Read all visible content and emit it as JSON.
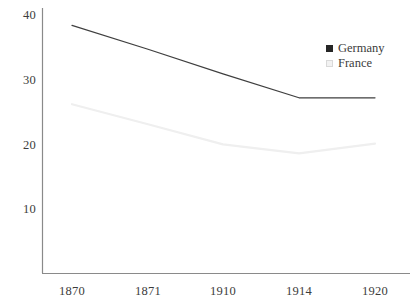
{
  "chart_data": {
    "type": "line",
    "title": "",
    "subtitle": "",
    "xlabel": "",
    "ylabel": "",
    "categories": [
      "1870",
      "1871",
      "1910",
      "1914",
      "1920"
    ],
    "xtick_labels": [
      "1870",
      "1871",
      "1910",
      "1914",
      "1920"
    ],
    "ytick_labels": [
      "40",
      "30",
      "20",
      "10"
    ],
    "ytick_values": [
      40,
      30,
      20,
      10
    ],
    "ylim": [
      0,
      41
    ],
    "xlim_categories": [
      "1870",
      "1920"
    ],
    "grid": false,
    "legend_position": "top-right",
    "series": [
      {
        "name": "Germany",
        "color": "#3f3f3f",
        "marker": "filled-square",
        "values": [
          38.4,
          34.7,
          30.9,
          27.2,
          27.2
        ]
      },
      {
        "name": "France",
        "color": "#efefef",
        "marker": "outlined-square",
        "values": [
          26.2,
          23.1,
          20.0,
          18.6,
          20.1
        ]
      }
    ],
    "annotations": []
  },
  "legend": {
    "items": [
      {
        "label": "Germany",
        "swatch": "filled-square-icon"
      },
      {
        "label": "France",
        "swatch": "outlined-square-icon"
      }
    ]
  },
  "axes": {
    "y_labels": [
      "40",
      "30",
      "20",
      "10"
    ],
    "x_labels": [
      "1870",
      "1871",
      "1910",
      "1914",
      "1920"
    ]
  },
  "colors": {
    "germany_line": "#3f3f3f",
    "france_line": "#efefef",
    "axis": "#8a8a8a",
    "text": "#3c3c3c",
    "background": "#ffffff"
  }
}
